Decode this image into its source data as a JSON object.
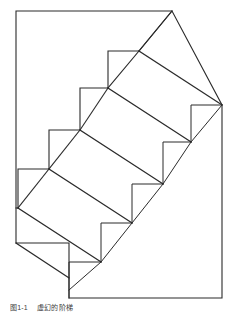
{
  "figure": {
    "caption_label": "图1-1",
    "caption_title": "虚幻的阶梯",
    "stroke_color": "#2b2b2b",
    "fill_color": "#ffffff",
    "background_color": "#ffffff",
    "stroke_width": 1,
    "step_count": 6
  },
  "diagram_data": {
    "type": "line-drawing",
    "name": "schroeder-staircase-illusion",
    "description": "Ambiguous staircase line drawing (Schroeder staircase) inside a rectangular frame with an oblique top-right face",
    "canvas": {
      "width": 233,
      "height": 315
    },
    "outer_outline": [
      [
        16,
        11
      ],
      [
        172,
        11
      ],
      [
        222,
        105
      ],
      [
        222,
        298
      ],
      [
        69,
        298
      ],
      [
        69,
        255
      ],
      [
        16,
        255
      ],
      [
        16,
        11
      ]
    ],
    "step_corners": [
      [
        139,
        51
      ],
      [
        108,
        88
      ],
      [
        80,
        130
      ],
      [
        49,
        169
      ],
      [
        18,
        208
      ]
    ],
    "step_dx": -30,
    "step_dy": 39,
    "tread_lines": [
      {
        "from": [
          139,
          51
        ],
        "to": [
          172,
          11
        ]
      },
      {
        "from": [
          108,
          88
        ],
        "to": [
          139,
          51
        ]
      },
      {
        "from": [
          80,
          130
        ],
        "to": [
          108,
          88
        ]
      },
      {
        "from": [
          49,
          169
        ],
        "to": [
          80,
          130
        ]
      },
      {
        "from": [
          18,
          208
        ],
        "to": [
          49,
          169
        ]
      }
    ],
    "diagonal_lines": [
      {
        "from": [
          139,
          51
        ],
        "to": [
          222,
          105
        ]
      },
      {
        "from": [
          108,
          88
        ],
        "to": [
          191,
          142
        ]
      },
      {
        "from": [
          80,
          130
        ],
        "to": [
          163,
          184
        ]
      },
      {
        "from": [
          49,
          169
        ],
        "to": [
          132,
          223
        ]
      },
      {
        "from": [
          18,
          208
        ],
        "to": [
          101,
          262
        ]
      },
      {
        "from": [
          16,
          255
        ],
        "to": [
          69,
          290
        ]
      }
    ]
  }
}
